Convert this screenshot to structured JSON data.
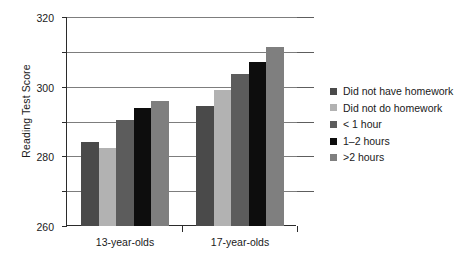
{
  "chart_data": {
    "type": "bar",
    "title": "",
    "xlabel": "",
    "ylabel": "Reading Test Score",
    "categories": [
      "13-year-olds",
      "17-year-olds"
    ],
    "ylim": [
      200,
      320
    ],
    "yticks": [
      200,
      220,
      240,
      260,
      280,
      300,
      320
    ],
    "ytick_labels": [
      "200",
      "220",
      "240",
      "260",
      "280",
      "300",
      "320"
    ],
    "grid": true,
    "legend_position": "right",
    "series": [
      {
        "name": "Did not have homework",
        "color": "#4a4a4a",
        "values": [
          248,
          269
        ]
      },
      {
        "name": "Did not do homework",
        "color": "#b2b2b2",
        "values": [
          245,
          278
        ]
      },
      {
        "name": "< 1 hour",
        "color": "#5c5c5c",
        "values": [
          261,
          287
        ]
      },
      {
        "name": "1–2 hours",
        "color": "#0d0d0d",
        "values": [
          268,
          294
        ]
      },
      {
        "name": ">2 hours",
        "color": "#7f7f7f",
        "values": [
          272,
          303
        ]
      }
    ]
  }
}
